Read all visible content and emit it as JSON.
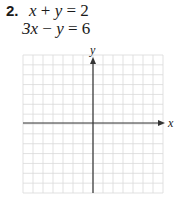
{
  "problem": {
    "number": "2.",
    "equations": [
      "x + y = 2",
      "3x − y = 6"
    ],
    "equation_parts": [
      {
        "a": "x",
        "op1": " + ",
        "b": "y",
        "rest": " = 2"
      },
      {
        "a": "3x",
        "op1": " − ",
        "b": "y",
        "rest": " = 6"
      }
    ]
  },
  "graph": {
    "x_axis_label": "x",
    "y_axis_label": "y",
    "grid_columns": 14,
    "grid_rows": 14,
    "grid_color": "#d9d9d9",
    "axis_color": "#333333"
  }
}
